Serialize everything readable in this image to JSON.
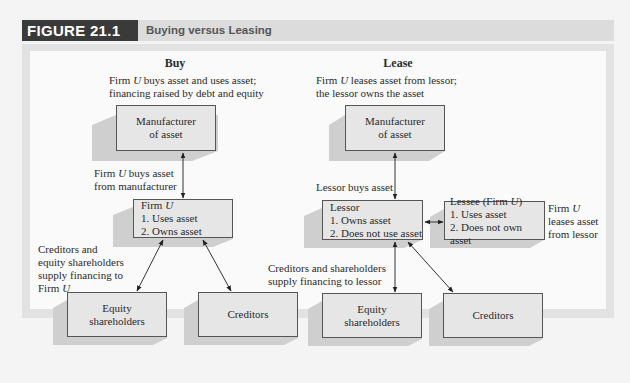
{
  "figure": {
    "label": "FIGURE 21.1",
    "title": "Buying versus Leasing"
  },
  "buy": {
    "heading": "Buy",
    "description_line1_pre": "Firm ",
    "description_line1_var": "U",
    "description_line1_post": " buys asset and uses asset;",
    "description_line2": "financing raised by debt and equity",
    "manufacturer": {
      "line1": "Manufacturer",
      "line2": "of asset"
    },
    "arrow_label_line1_pre": "Firm ",
    "arrow_label_line1_var": "U",
    "arrow_label_line1_post": " buys asset",
    "arrow_label_line2": "from manufacturer",
    "firm": {
      "title_pre": "Firm ",
      "title_var": "U",
      "item1": "1. Uses asset",
      "item2": "2. Owns asset"
    },
    "financing_label_line1": "Creditors and",
    "financing_label_line2": "equity shareholders",
    "financing_label_line3": "supply financing to",
    "financing_label_line4_pre": "Firm ",
    "financing_label_line4_var": "U",
    "equity": {
      "line1": "Equity",
      "line2": "shareholders"
    },
    "creditors": {
      "line1": "Creditors"
    }
  },
  "lease": {
    "heading": "Lease",
    "description_line1_pre": "Firm ",
    "description_line1_var": "U",
    "description_line1_post": " leases asset from lessor;",
    "description_line2": "the lessor owns the asset",
    "manufacturer": {
      "line1": "Manufacturer",
      "line2": "of asset"
    },
    "arrow_label": "Lessor buys asset",
    "lessor": {
      "title": "Lessor",
      "item1": "1. Owns asset",
      "item2": "2. Does not use asset"
    },
    "lessee": {
      "title_pre": "Lessee (Firm ",
      "title_var": "U",
      "title_post": ")",
      "item1": "1. Uses asset",
      "item2": "2. Does not own asset"
    },
    "lessee_label_line1_pre": "Firm ",
    "lessee_label_line1_var": "U",
    "lessee_label_line2": "leases asset",
    "lessee_label_line3": "from lessor",
    "financing_label_line1": "Creditors and shareholders",
    "financing_label_line2": "supply financing to lessor",
    "equity": {
      "line1": "Equity",
      "line2": "shareholders"
    },
    "creditors": {
      "line1": "Creditors"
    }
  }
}
